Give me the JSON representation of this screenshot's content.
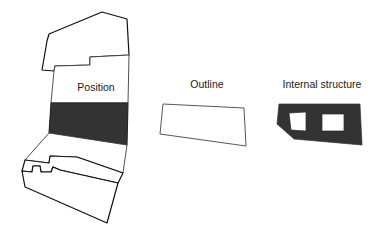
{
  "figure": {
    "background_color": "#ffffff",
    "stroke_color": "#111111",
    "highlight_color": "#333333",
    "fill_color": "#ffffff",
    "text_color": "#1a1a1a",
    "width": 384,
    "height": 235
  },
  "panels": [
    {
      "id": "position",
      "label": "Position",
      "label_x": 96,
      "label_y": 88
    },
    {
      "id": "outline",
      "label": "Outline",
      "label_x": 207,
      "label_y": 85
    },
    {
      "id": "internal_structure",
      "label": "Internal structure",
      "label_x": 322,
      "label_y": 85
    }
  ],
  "chart_data": {
    "type": "diagram",
    "title": "",
    "panels": [
      {
        "name": "Position",
        "description": "Stacked quadrilateral bands of a column; one band filled dark to mark position",
        "bands": [
          {
            "index": 0,
            "state": "unfilled",
            "fill": "#ffffff",
            "stroke_weight": "thick",
            "points": "102,12 49,34 47,41 42,70 54,71 55,66 90,65 90,57 129,55 127,19"
          },
          {
            "index": 1,
            "state": "unfilled",
            "fill": "#ffffff",
            "stroke_weight": "thin",
            "points": "90,57 90,65 55,66 54,71 51,103 128,103 129,55"
          },
          {
            "index": 2,
            "state": "highlighted",
            "fill": "#333333",
            "stroke_weight": "thick",
            "points": "51,103 49,133 127,145 128,103 80,103"
          },
          {
            "index": 3,
            "state": "unfilled",
            "fill": "#ffffff",
            "stroke_weight": "thin",
            "points": "49,133 25,160 49,163 50,156 77,157 123,173 127,145"
          },
          {
            "index": 4,
            "state": "unfilled",
            "fill": "#ffffff",
            "stroke_weight": "thick",
            "points": "25,160 22,171 32,172 33,166 40,166 41,172 51,172 53,167 60,170 118,183 123,173 77,157 50,156 49,163"
          },
          {
            "index": 5,
            "state": "unfilled",
            "fill": "#ffffff",
            "stroke_weight": "thick",
            "points": "22,171 25,187 32,190 107,223 118,183 60,170 53,167 51,172 41,172 40,166 33,166 32,172"
          }
        ]
      },
      {
        "name": "Outline",
        "description": "Single closed polygon of the element boundary",
        "points": "163,104 244,108 246,146 203,140 160,134"
      },
      {
        "name": "Internal structure",
        "description": "Filled block with two rectangular voids",
        "points": "279,104 360,104 362,145 294,139 277,124",
        "holes": [
          {
            "points": "289,113 306,112 306,131 291,130"
          },
          {
            "points": "322,114 344,114 344,131 322,131"
          }
        ]
      }
    ]
  }
}
